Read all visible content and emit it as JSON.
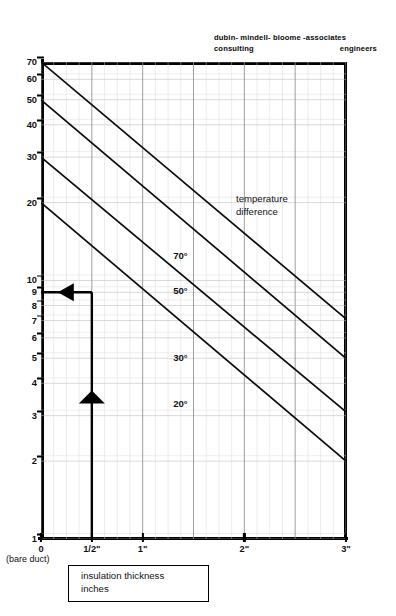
{
  "header": {
    "firm_line1": "dubin- mindell- bloome -associates",
    "firm_consulting": "consulting",
    "firm_engineers": "engineers"
  },
  "caption": {
    "line1": "insulation thickness",
    "line2": "inches"
  },
  "axis": {
    "bare_duct_note": "(bare duct)"
  },
  "chart_data": {
    "type": "line",
    "title": "",
    "xlabel": "insulation thickness inches",
    "ylabel": "",
    "x_scale": "linear",
    "y_scale": "log",
    "xlim": [
      0,
      3
    ],
    "ylim": [
      1,
      70
    ],
    "grid": true,
    "legend_position": "inline-right",
    "legend_title": "temperature difference",
    "legend_title_line1": "temperature",
    "legend_title_line2": "difference",
    "x_ticks": [
      {
        "value": 0,
        "label": "0"
      },
      {
        "value": 0.5,
        "label": "1/2\""
      },
      {
        "value": 1,
        "label": "1\""
      },
      {
        "value": 2,
        "label": "2\""
      },
      {
        "value": 3,
        "label": "3\""
      }
    ],
    "y_ticks": [
      {
        "value": 70,
        "label": "70"
      },
      {
        "value": 60,
        "label": "60"
      },
      {
        "value": 50,
        "label": "50"
      },
      {
        "value": 40,
        "label": "40"
      },
      {
        "value": 30,
        "label": "30"
      },
      {
        "value": 20,
        "label": "20"
      },
      {
        "value": 10,
        "label": "10"
      },
      {
        "value": 9,
        "label": "9"
      },
      {
        "value": 8,
        "label": "8"
      },
      {
        "value": 7,
        "label": "7"
      },
      {
        "value": 6,
        "label": "6"
      },
      {
        "value": 5,
        "label": "5"
      },
      {
        "value": 4,
        "label": "4"
      },
      {
        "value": 3,
        "label": "3"
      },
      {
        "value": 2,
        "label": "2"
      },
      {
        "value": 1,
        "label": "1"
      }
    ],
    "series": [
      {
        "name": "70°",
        "label": "70°",
        "label_x": 1.3,
        "label_y": 13.1,
        "x": [
          0,
          3
        ],
        "y": [
          70,
          7.1
        ]
      },
      {
        "name": "50°",
        "label": "50°",
        "label_x": 1.3,
        "label_y": 9.6,
        "x": [
          0,
          3
        ],
        "y": [
          50,
          5.0
        ]
      },
      {
        "name": "30°",
        "label": "30°",
        "label_x": 1.3,
        "label_y": 5.3,
        "x": [
          0,
          3
        ],
        "y": [
          30,
          3.1
        ]
      },
      {
        "name": "20°",
        "label": "20°",
        "label_x": 1.3,
        "label_y": 3.5,
        "x": [
          0,
          3
        ],
        "y": [
          20,
          2.0
        ]
      }
    ],
    "annotations": [
      {
        "type": "reading-arrow-vertical",
        "x": 0.5,
        "y_from": 1.0,
        "y_to": 9.0
      },
      {
        "type": "reading-arrow-horizontal",
        "y": 9.0,
        "x_from": 0.5,
        "x_to": 0.0
      }
    ]
  }
}
